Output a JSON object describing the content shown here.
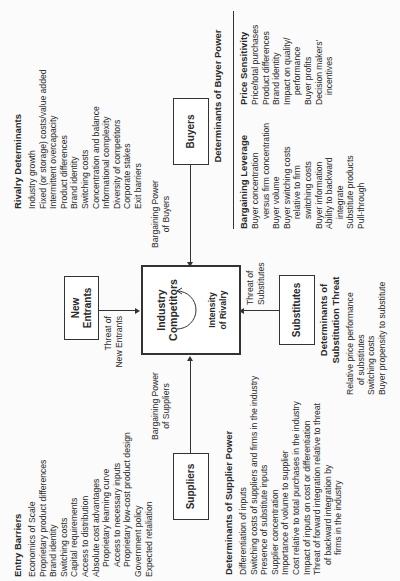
{
  "diagram": {
    "center": {
      "title": "Industry Competitors",
      "rivalry_label_line1": "Intensity",
      "rivalry_label_line2": "of Rivalry"
    },
    "forces": {
      "new_entrants": {
        "line1": "New",
        "line2": "Entrants"
      },
      "suppliers": "Suppliers",
      "buyers": "Buyers",
      "substitutes": "Substitutes"
    },
    "arrow_labels": {
      "new_entrants": {
        "line1": "Threat of",
        "line2": "New Entrants"
      },
      "suppliers": {
        "line1": "Bargaining Power",
        "line2": "of Suppliers"
      },
      "buyers": {
        "line1": "Bargaining Power",
        "line2": "of Buyers"
      },
      "substitutes": {
        "line1": "Threat of",
        "line2": "Substitutes"
      }
    },
    "rivalry_determinants": {
      "heading": "Rivalry Determinants",
      "items": [
        "Industry growth",
        "Fixed (or storage) costs/value added",
        "Intermittent overcapacity",
        "Product differences",
        "Brand identity",
        "Switching costs",
        "Concentration and balance",
        "Informational complexity",
        "Diversity of competitors",
        "Corporate stakes",
        "Exit barriers"
      ]
    },
    "entry_barriers": {
      "heading": "Entry Barriers",
      "items": [
        {
          "text": "Economics of Scale",
          "indent": false
        },
        {
          "text": "Proprietary product differences",
          "indent": false
        },
        {
          "text": "Brand identity",
          "indent": false
        },
        {
          "text": "Switching costs",
          "indent": false
        },
        {
          "text": "Capital requirements",
          "indent": false
        },
        {
          "text": "Access to distribution",
          "indent": false
        },
        {
          "text": "Absolute cost advantages",
          "indent": false
        },
        {
          "text": "Proprietary learning curve",
          "indent": true
        },
        {
          "text": "Access to necessary inputs",
          "indent": true
        },
        {
          "text": "Proprietary low-cost product design",
          "indent": true
        },
        {
          "text": "Government policy",
          "indent": false
        },
        {
          "text": "Expected retaliation",
          "indent": false
        }
      ]
    },
    "supplier_power": {
      "heading": "Determinants of Supplier Power",
      "items": [
        {
          "text": "Differentiation of inputs",
          "indent": false
        },
        {
          "text": "Switching costs of suppliers and firms in the industry",
          "indent": false
        },
        {
          "text": "Presence of substitute inputs",
          "indent": false
        },
        {
          "text": "Supplier concentration",
          "indent": false
        },
        {
          "text": "Importance of volume to supplier",
          "indent": false
        },
        {
          "text": "Cost relative to total purchases in the industry",
          "indent": false
        },
        {
          "text": "Impact of inputs on cost or differentiation",
          "indent": false
        },
        {
          "text": "Threat of forward integration relative to threat",
          "indent": false
        },
        {
          "text": "of backward integration by",
          "indent": true
        },
        {
          "text": "firms in the industry",
          "indent": true
        }
      ]
    },
    "substitution_threat": {
      "heading_line1": "Determinants of",
      "heading_line2": "Substitution Threat",
      "items": [
        {
          "text": "Relative price performance",
          "indent": false
        },
        {
          "text": "of substitutes",
          "indent": true
        },
        {
          "text": "Switching costs",
          "indent": false
        },
        {
          "text": "Buyer propensity to substitute",
          "indent": false
        }
      ]
    },
    "buyer_power": {
      "heading": "Determinants of Buyer Power",
      "bargaining_leverage": {
        "heading": "Bargaining Leverage",
        "items": [
          {
            "text": "Buyer concentration",
            "indent": false
          },
          {
            "text": "versus firm concentration",
            "indent": true
          },
          {
            "text": "Buyer volume",
            "indent": false
          },
          {
            "text": "Buyer switching costs",
            "indent": false
          },
          {
            "text": "relative to firm",
            "indent": true
          },
          {
            "text": "switching costs",
            "indent": true
          },
          {
            "text": "Buyer information",
            "indent": false
          },
          {
            "text": "Ability to backward",
            "indent": false
          },
          {
            "text": "integrate",
            "indent": true
          },
          {
            "text": "Substitute products",
            "indent": false
          },
          {
            "text": "Pull-through",
            "indent": false
          }
        ]
      },
      "price_sensitivity": {
        "heading": "Price Sensitivity",
        "items": [
          {
            "text": "Price/total purchases",
            "indent": false
          },
          {
            "text": "Product differences",
            "indent": false
          },
          {
            "text": "Brand identity",
            "indent": false
          },
          {
            "text": "Impact on quality/",
            "indent": false
          },
          {
            "text": "performance",
            "indent": true
          },
          {
            "text": "Buyer profits",
            "indent": false
          },
          {
            "text": "Decision makers'",
            "indent": false
          },
          {
            "text": "incentives",
            "indent": true
          }
        ]
      }
    }
  }
}
